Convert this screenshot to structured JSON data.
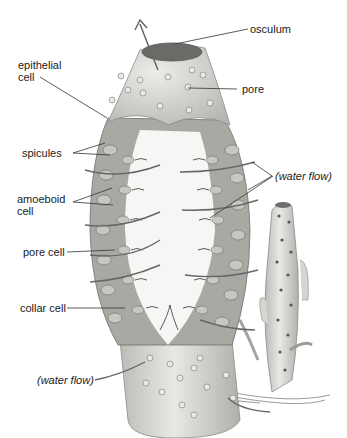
{
  "diagram": {
    "labels": {
      "osculum": "osculum",
      "epithelial_1": "epithelial",
      "epithelial_2": "cell",
      "pore": "pore",
      "spicules": "spicules",
      "water_flow_right": "(water flow)",
      "amoeboid_1": "amoeboid",
      "amoeboid_2": "cell",
      "pore_cell": "pore cell",
      "collar_cell": "collar cell",
      "water_flow_bottom": "(water flow)"
    },
    "colors": {
      "body": "#dcdcd8",
      "body_shade": "#b9b9b4",
      "cavity": "#f6f6f4",
      "cells": "#8e8e8a",
      "line": "#333333",
      "text": "#1a1a1a"
    }
  }
}
